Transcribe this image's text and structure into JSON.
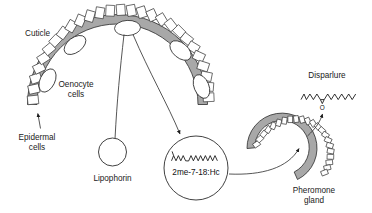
{
  "figure": {
    "type": "biological-pathway-diagram",
    "background_color": "#ffffff",
    "line_color": "#2b2b2b",
    "cuticle_fill": "#a8a8a8",
    "cell_fill": "#ffffff"
  },
  "labels": {
    "cuticle": "Cuticle",
    "oenocyte_cells_line1": "Oenocyte",
    "oenocyte_cells_line2": "cells",
    "epidermal_cells_line1": "Epidermal",
    "epidermal_cells_line2": "cells",
    "lipophorin": "Lipophorin",
    "hydrocarbon": "2me-7-18:Hc",
    "disparlure": "Disparlure",
    "pheromone_gland_line1": "Pheromone",
    "pheromone_gland_line2": "gland",
    "epoxide_oxygen": "O"
  },
  "structures": {
    "hydrocarbon_molecule": {
      "name": "2me-7-18:Hc",
      "description": "2-methyl branched heptadecane / 18-carbon methyl-branched hydrocarbon drawn as zigzag with terminal methyl branch",
      "branch_points": 1,
      "zigzag_segments": 14
    },
    "disparlure_molecule": {
      "name": "Disparlure",
      "description": "cis-7,8-epoxy-2-methyloctadecane, drawn as zigzag chain with methyl branch at left and epoxide ring bearing oxygen below the chain",
      "epoxide_label": "O",
      "branch_points": 1,
      "zigzag_segments": 16
    }
  },
  "body_wall": {
    "name": "insect-body-wall-arc",
    "layers": [
      "cuticle",
      "epidermal cells",
      "oenocyte cells"
    ],
    "epidermal_cell_count": 26,
    "oenocyte_count": 5
  },
  "pheromone_gland": {
    "name": "pheromone-gland-arc",
    "layers": [
      "cuticle",
      "gland cells"
    ],
    "cell_count": 22
  },
  "arrows": [
    {
      "name": "epidermal-cells-pointer",
      "from": "Epidermal cells label",
      "to": "epidermal cell at arc terminus"
    },
    {
      "name": "oenocyte-to-lipophorin",
      "from": "oenocyte cell",
      "to": "Lipophorin vesicle"
    },
    {
      "name": "oenocyte-to-hydrocarbon",
      "from": "oenocyte cell",
      "to": "2me-7-18:Hc vesicle"
    },
    {
      "name": "hydrocarbon-to-gland",
      "from": "2me-7-18:Hc vesicle",
      "to": "Pheromone gland"
    },
    {
      "name": "gland-to-disparlure",
      "from": "Pheromone gland",
      "to": "Disparlure"
    }
  ]
}
